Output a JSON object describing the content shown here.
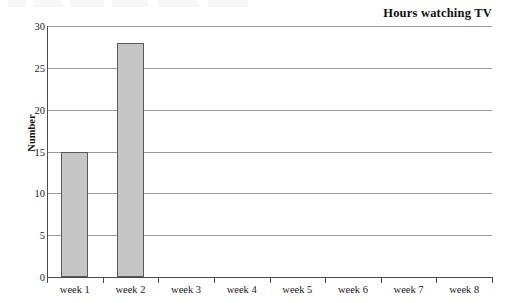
{
  "chart_data": {
    "type": "bar",
    "title": "Hours watching TV",
    "xlabel": "",
    "ylabel": "Number",
    "categories": [
      "week 1",
      "week 2",
      "week 3",
      "week 4",
      "week 5",
      "week 6",
      "week 7",
      "week 8"
    ],
    "values": [
      15,
      28,
      0,
      0,
      0,
      0,
      0,
      0
    ],
    "ylim": [
      0,
      30
    ],
    "y_ticks": [
      0,
      5,
      10,
      15,
      20,
      25,
      30
    ],
    "y_tick_labels": [
      "0",
      "5",
      "10",
      "15",
      "20",
      "25",
      "30"
    ],
    "grid": true,
    "legend": false,
    "series": [
      {
        "name": "Hours watching TV",
        "values": [
          15,
          28,
          0,
          0,
          0,
          0,
          0,
          0
        ]
      }
    ],
    "colors": {
      "bar_fill": "#c6c6c6",
      "bar_border": "#5a5a5a",
      "gridline": "#9a9a9a",
      "axis": "#4a4a4a",
      "text": "#1a1a1a",
      "background": "#ffffff"
    }
  }
}
